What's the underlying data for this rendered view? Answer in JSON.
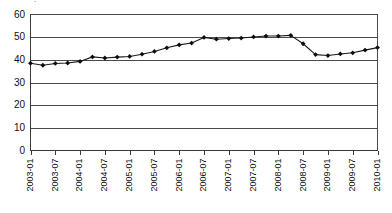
{
  "chart_data": {
    "type": "line",
    "title": "",
    "xlabel": "",
    "ylabel": "",
    "ylim": [
      0,
      60
    ],
    "ytick_values": [
      0,
      10,
      20,
      30,
      40,
      50,
      60
    ],
    "ytick_labels": [
      "0",
      "10",
      "20",
      "30",
      "40",
      "50",
      "60"
    ],
    "grid": true,
    "grid_axis": "y",
    "legend": "none",
    "marker": "diamond",
    "xtick_labels": [
      "2003-01",
      "2003-07",
      "2004-01",
      "2004-07",
      "2005-01",
      "2005-07",
      "2006-01",
      "2006-07",
      "2007-01",
      "2007-07",
      "2008-01",
      "2008-07",
      "2009-01",
      "2009-07",
      "2010-01"
    ],
    "x": [
      "2003-01",
      "2003-04",
      "2003-07",
      "2003-10",
      "2004-01",
      "2004-04",
      "2004-07",
      "2004-10",
      "2005-01",
      "2005-04",
      "2005-07",
      "2005-10",
      "2006-01",
      "2006-04",
      "2006-07",
      "2006-10",
      "2007-01",
      "2007-04",
      "2007-07",
      "2007-10",
      "2008-01",
      "2008-04",
      "2008-07",
      "2008-10",
      "2009-01",
      "2009-04",
      "2009-07",
      "2009-10",
      "2010-01"
    ],
    "values": [
      38.5,
      37.6,
      38.4,
      38.6,
      39.3,
      41.3,
      40.8,
      41.2,
      41.5,
      42.5,
      43.7,
      45.3,
      46.6,
      47.4,
      49.9,
      49.1,
      49.4,
      49.6,
      50.1,
      50.5,
      50.5,
      50.8,
      47.1,
      42.3,
      41.9,
      42.6,
      43.1,
      44.3,
      45.4
    ],
    "series": [
      {
        "name": "series-1",
        "color": "#111111",
        "values": [
          38.5,
          37.6,
          38.4,
          38.6,
          39.3,
          41.3,
          40.8,
          41.2,
          41.5,
          42.5,
          43.7,
          45.3,
          46.6,
          47.4,
          49.9,
          49.1,
          49.4,
          49.6,
          50.1,
          50.5,
          50.5,
          50.8,
          47.1,
          42.3,
          41.9,
          42.6,
          43.1,
          44.3,
          45.4
        ]
      }
    ]
  },
  "colors": {
    "series": "#111111",
    "grid": "#4a4a4a",
    "axis": "#3a3a3a",
    "background": "#ffffff",
    "text": "#111111"
  },
  "title_stub": "."
}
